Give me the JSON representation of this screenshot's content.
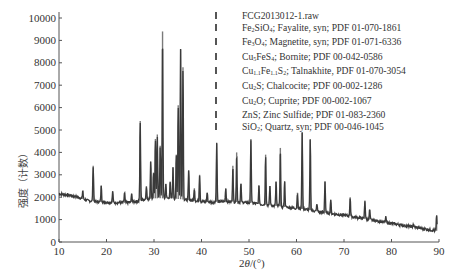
{
  "chart_data": {
    "type": "line",
    "title": "",
    "xlabel": "2θ/(°)",
    "ylabel": "强度（计数）",
    "xlim": [
      10,
      90
    ],
    "ylim": [
      0,
      10000
    ],
    "xticks": [
      10,
      20,
      30,
      40,
      50,
      60,
      70,
      80,
      90
    ],
    "yticks": [
      0,
      1000,
      2000,
      3000,
      4000,
      5000,
      6000,
      7000,
      8000,
      9000,
      10000
    ],
    "grid": false,
    "legend_position": "top-right",
    "legend": [
      "FCG2013012-1.raw",
      "Fe2SiO4; Fayalite, syn; PDF 01-070-1861",
      "Fe3O4; Magnetite, syn; PDF 01-071-6336",
      "Cu5FeS4; Bornite; PDF 00-042-0586",
      "Cu1.1Fe1.1S2; Talnakhite, PDF 01-070-3054",
      "Cu2S; Chalcocite; PDF 00-002-1286",
      "Cu2O; Cuprite; PDF 00-002-1067",
      "ZnS; Zinc Sulfide; PDF 01-083-2360",
      "SiO2; Quartz, syn; PDF 00-046-1045"
    ],
    "series": [
      {
        "name": "FCG2013012-1.raw",
        "baseline": [
          [
            10,
            2150
          ],
          [
            12,
            2100
          ],
          [
            14,
            2000
          ],
          [
            16,
            1850
          ],
          [
            18,
            1800
          ],
          [
            20,
            1780
          ],
          [
            22,
            1760
          ],
          [
            24,
            1750
          ],
          [
            26,
            1800
          ],
          [
            28,
            1900
          ],
          [
            30,
            1950
          ],
          [
            32,
            1950
          ],
          [
            34,
            1950
          ],
          [
            36,
            1900
          ],
          [
            38,
            1850
          ],
          [
            40,
            1800
          ],
          [
            42,
            1780
          ],
          [
            44,
            1800
          ],
          [
            46,
            1800
          ],
          [
            48,
            1780
          ],
          [
            50,
            1750
          ],
          [
            52,
            1700
          ],
          [
            54,
            1650
          ],
          [
            56,
            1600
          ],
          [
            58,
            1550
          ],
          [
            60,
            1500
          ],
          [
            62,
            1450
          ],
          [
            64,
            1380
          ],
          [
            66,
            1300
          ],
          [
            68,
            1250
          ],
          [
            70,
            1200
          ],
          [
            72,
            1120
          ],
          [
            74,
            1050
          ],
          [
            76,
            980
          ],
          [
            78,
            900
          ],
          [
            80,
            830
          ],
          [
            82,
            760
          ],
          [
            84,
            690
          ],
          [
            86,
            620
          ],
          [
            88,
            550
          ],
          [
            89.5,
            500
          ]
        ],
        "peaks": [
          {
            "x": 15.0,
            "y": 2300
          },
          {
            "x": 17.2,
            "y": 3400
          },
          {
            "x": 18.9,
            "y": 2500
          },
          {
            "x": 21.3,
            "y": 2250
          },
          {
            "x": 23.8,
            "y": 2200
          },
          {
            "x": 25.3,
            "y": 2150
          },
          {
            "x": 27.1,
            "y": 5400
          },
          {
            "x": 28.4,
            "y": 2500
          },
          {
            "x": 29.3,
            "y": 3600
          },
          {
            "x": 29.9,
            "y": 3100
          },
          {
            "x": 30.3,
            "y": 4600
          },
          {
            "x": 30.7,
            "y": 4800
          },
          {
            "x": 31.3,
            "y": 4300
          },
          {
            "x": 31.8,
            "y": 9400
          },
          {
            "x": 32.5,
            "y": 2600
          },
          {
            "x": 33.4,
            "y": 2700
          },
          {
            "x": 34.0,
            "y": 3300
          },
          {
            "x": 34.7,
            "y": 3900
          },
          {
            "x": 35.1,
            "y": 6100
          },
          {
            "x": 35.6,
            "y": 8600
          },
          {
            "x": 36.1,
            "y": 7800
          },
          {
            "x": 37.3,
            "y": 3200
          },
          {
            "x": 38.5,
            "y": 2400
          },
          {
            "x": 39.6,
            "y": 3000
          },
          {
            "x": 41.2,
            "y": 2200
          },
          {
            "x": 43.2,
            "y": 4400
          },
          {
            "x": 45.1,
            "y": 2400
          },
          {
            "x": 46.6,
            "y": 3400
          },
          {
            "x": 47.4,
            "y": 4000
          },
          {
            "x": 48.3,
            "y": 2600
          },
          {
            "x": 50.4,
            "y": 4600
          },
          {
            "x": 52.1,
            "y": 2500
          },
          {
            "x": 53.5,
            "y": 3900
          },
          {
            "x": 54.4,
            "y": 2500
          },
          {
            "x": 55.7,
            "y": 2700
          },
          {
            "x": 56.6,
            "y": 4200
          },
          {
            "x": 57.5,
            "y": 2700
          },
          {
            "x": 60.2,
            "y": 2200
          },
          {
            "x": 61.2,
            "y": 4900
          },
          {
            "x": 62.9,
            "y": 4600
          },
          {
            "x": 64.3,
            "y": 1700
          },
          {
            "x": 66.0,
            "y": 2700
          },
          {
            "x": 67.2,
            "y": 1900
          },
          {
            "x": 71.3,
            "y": 2000
          },
          {
            "x": 74.4,
            "y": 1850
          },
          {
            "x": 75.4,
            "y": 1450
          },
          {
            "x": 78.8,
            "y": 1100
          },
          {
            "x": 84.6,
            "y": 800
          },
          {
            "x": 89.5,
            "y": 1150
          }
        ]
      }
    ],
    "markers": {
      "reference_dash_x": 43.5,
      "reference_dash_color": "#555555"
    },
    "colors": {
      "trace": "#3a3a3a",
      "peaks": "#7a7a7a",
      "axis": "#555555"
    }
  }
}
